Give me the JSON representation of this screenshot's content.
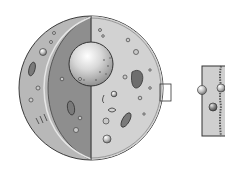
{
  "diagram": {
    "style": "grayscale illustration",
    "parts": [
      {
        "id": "cell-membrane",
        "label": ""
      },
      {
        "id": "cytoplasm",
        "label": ""
      },
      {
        "id": "nucleus",
        "label": ""
      },
      {
        "id": "mitochondria",
        "label": ""
      },
      {
        "id": "vesicles",
        "label": ""
      },
      {
        "id": "golgi-apparatus",
        "label": ""
      },
      {
        "id": "membrane-zoom-box",
        "label": ""
      },
      {
        "id": "membrane-inset",
        "label": ""
      }
    ]
  },
  "colors": {
    "outline": "#3a3a3a",
    "cytoplasm_light": "#cfcfcf",
    "cytoplasm_dark": "#8e8e8e",
    "shell": "#b4b4b4",
    "nucleus_highlight": "#ffffff",
    "nucleus_shade": "#a0a0a0",
    "background": "#ffffff"
  }
}
